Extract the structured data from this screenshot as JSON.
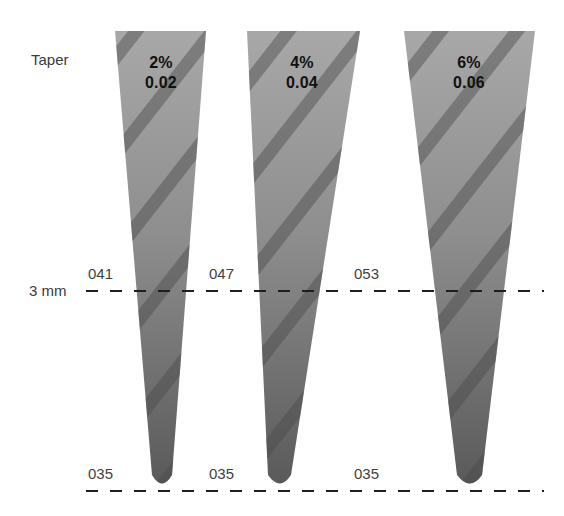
{
  "diagram": {
    "row_label": "Taper",
    "reference_label": "3 mm",
    "colors": {
      "cone_fill_top": "#a6a6a6",
      "cone_fill_bottom": "#5e5e5e",
      "stripe": "#6f6f6f",
      "dash": "#1e1e1e",
      "text": "#3a3a3a"
    },
    "cones": [
      {
        "percent": "2%",
        "decimal": "0.02",
        "diameter_3mm": "041",
        "tip_diameter": "035"
      },
      {
        "percent": "4%",
        "decimal": "0.04",
        "diameter_3mm": "047",
        "tip_diameter": "035"
      },
      {
        "percent": "6%",
        "decimal": "0.06",
        "diameter_3mm": "053",
        "tip_diameter": "035"
      }
    ]
  }
}
